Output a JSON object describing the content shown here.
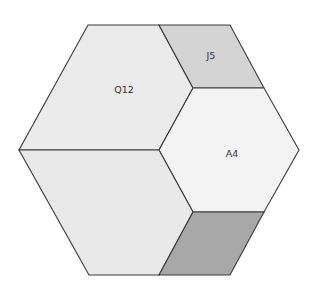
{
  "diagram": {
    "title": "",
    "shape": "hexagon",
    "stroke_color": "#3a3a3a",
    "regions": [
      {
        "id": "Q12",
        "label": "Q12",
        "fill": "#ebebeb",
        "points": "88,25 159,25 193,88 159,150 19,150",
        "label_pos": [
          124,
          89
        ]
      },
      {
        "id": "J5",
        "label": "J5",
        "fill": "#d4d4d4",
        "points": "159,25 230,25 264,88 193,88",
        "label_pos": [
          211,
          55
        ]
      },
      {
        "id": "A4",
        "label": "A4",
        "fill": "#f3f3f3",
        "points": "193,88 264,88 299,150 264,212 193,212 159,150",
        "label_pos": [
          232,
          153
        ]
      },
      {
        "id": "bottom-left",
        "label": "",
        "fill": "#e9e9e9",
        "points": "19,150 159,150 193,212 159,275 89,275",
        "label_pos": null
      },
      {
        "id": "bottom-right",
        "label": "",
        "fill": "#a8a8a8",
        "points": "193,212 264,212 230,275 159,275",
        "label_pos": null
      }
    ]
  }
}
